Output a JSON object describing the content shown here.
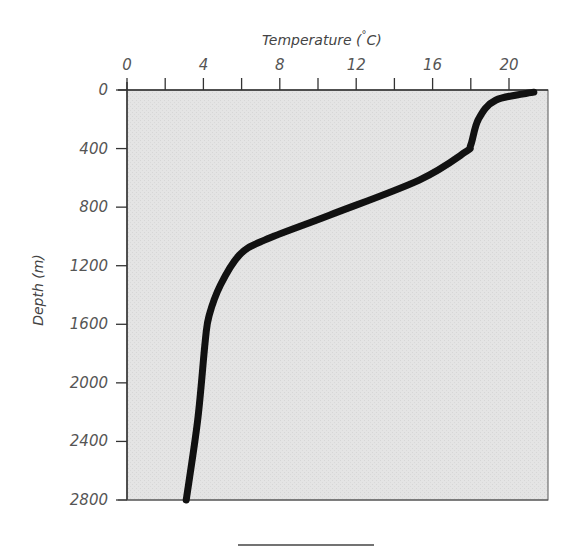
{
  "chart_data": {
    "type": "line",
    "title": "",
    "xlabel": "Temperature (°C)",
    "ylabel": "Depth (m)",
    "x_axis_position": "top",
    "y_axis_inverted": true,
    "xlim": [
      0,
      22
    ],
    "ylim": [
      0,
      2800
    ],
    "xticks": [
      0,
      4,
      8,
      12,
      16,
      20
    ],
    "xticks_minor": [
      2,
      6,
      10,
      14,
      18
    ],
    "yticks": [
      0,
      400,
      800,
      1200,
      1600,
      2000,
      2400,
      2800
    ],
    "grid": false,
    "legend": null,
    "series": [
      {
        "name": "Temperature profile",
        "color": "#111111",
        "points": [
          {
            "temp": 21.3,
            "depth": 15
          },
          {
            "temp": 19.3,
            "depth": 70
          },
          {
            "temp": 18.4,
            "depth": 200
          },
          {
            "temp": 18.0,
            "depth": 375
          },
          {
            "temp": 17.7,
            "depth": 425
          },
          {
            "temp": 15.3,
            "depth": 615
          },
          {
            "temp": 10.6,
            "depth": 855
          },
          {
            "temp": 7.2,
            "depth": 1025
          },
          {
            "temp": 5.9,
            "depth": 1125
          },
          {
            "temp": 4.9,
            "depth": 1330
          },
          {
            "temp": 4.3,
            "depth": 1540
          },
          {
            "temp": 4.1,
            "depth": 1710
          },
          {
            "temp": 3.7,
            "depth": 2255
          },
          {
            "temp": 3.1,
            "depth": 2800
          }
        ]
      }
    ]
  },
  "labels": {
    "x_title": "Temperature (",
    "x_title_degree": "°",
    "x_title_unit": "C)",
    "y_title": "Depth (m)",
    "x_tick_labels": [
      "0",
      "4",
      "8",
      "12",
      "16",
      "20"
    ],
    "y_tick_labels": [
      "0",
      "400",
      "800",
      "1200",
      "1600",
      "2000",
      "2400",
      "2800"
    ]
  },
  "colors": {
    "plot_background": "#e4e4e4",
    "axis": "#333333",
    "curve": "#111111",
    "text": "#555555"
  }
}
